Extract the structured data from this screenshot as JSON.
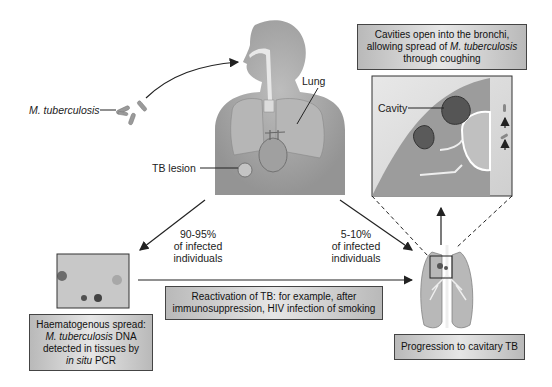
{
  "diagram": {
    "labels": {
      "pathogen": "M. tuberculosis",
      "lung": "Lung",
      "tb_lesion": "TB lesion",
      "cavity": "Cavity",
      "pct_latent": [
        "90-95%",
        "of infected",
        "individuals"
      ],
      "pct_active": [
        "5-10%",
        "of infected",
        "individuals"
      ]
    },
    "boxes": {
      "cavities": {
        "line1": "Cavities open into the bronchi,",
        "line2_pre": "allowing spread of ",
        "line2_italic": "M. tuberculosis",
        "line3": "through coughing"
      },
      "haematogenous": {
        "line1": "Haematogenous spread:",
        "line2_italic": "M. tuberculosis",
        "line2_post": " DNA",
        "line3": "detected in tissues by",
        "line4_italic": "in situ",
        "line4_post": " PCR"
      },
      "reactivation": {
        "line1": "Reactivation of TB: for example, after",
        "line2": "immunosuppression, HIV infection of smoking"
      },
      "progression": {
        "text": "Progression to cavitary TB"
      }
    },
    "colors": {
      "box_edge": "#b9b9b9",
      "box_center": "#e6e6e6",
      "body_gray": "#a8a8a8",
      "lung_gray": "#b4b4b4",
      "line": "#222222"
    }
  }
}
